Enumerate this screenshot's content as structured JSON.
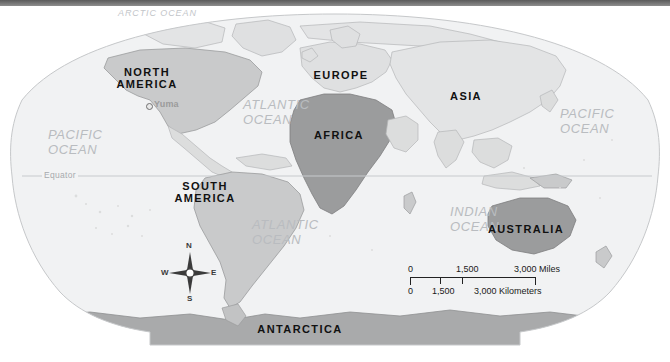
{
  "map": {
    "title": "World Map",
    "projection": "oval",
    "colors": {
      "ocean": "#f1f2f3",
      "land_light": "#dfe0e1",
      "land_mid": "#c9cacb",
      "land_dark": "#9b9c9d",
      "outline": "#b4b6b8",
      "ocean_label": "#b9bcc0",
      "continent_label": "#111111",
      "city_label": "#9b9b9b",
      "top_bar": "#6f6f6f"
    },
    "continents": [
      {
        "name": "NORTH\nAMERICA",
        "line1": "NORTH",
        "line2": "AMERICA",
        "x": 141,
        "y": 74
      },
      {
        "name": "SOUTH\nAMERICA",
        "line1": "SOUTH",
        "line2": "AMERICA",
        "x": 199,
        "y": 188
      },
      {
        "name": "EUROPE",
        "line1": "EUROPE",
        "line2": "",
        "x": 341,
        "y": 76
      },
      {
        "name": "AFRICA",
        "line1": "AFRICA",
        "line2": "",
        "x": 339,
        "y": 136
      },
      {
        "name": "ASIA",
        "line1": "ASIA",
        "line2": "",
        "x": 466,
        "y": 97
      },
      {
        "name": "AUSTRALIA",
        "line1": "AUSTRALIA",
        "line2": "",
        "x": 526,
        "y": 230
      },
      {
        "name": "ANTARCTICA",
        "line1": "ANTARCTICA",
        "line2": "",
        "x": 300,
        "y": 330
      }
    ],
    "oceans": [
      {
        "name": "ARCTIC OCEAN",
        "line1": "ARCTIC OCEAN",
        "line2": "",
        "x": 160,
        "y": 14,
        "size": "small"
      },
      {
        "name": "PACIFIC OCEAN",
        "line1": "PACIFIC",
        "line2": "OCEAN",
        "x": 84,
        "y": 138,
        "size": "normal"
      },
      {
        "name": "PACIFIC OCEAN",
        "line1": "PACIFIC",
        "line2": "OCEAN",
        "x": 592,
        "y": 117,
        "size": "normal"
      },
      {
        "name": "ATLANTIC OCEAN",
        "line1": "ATLANTIC",
        "line2": "OCEAN",
        "x": 282,
        "y": 108,
        "size": "normal"
      },
      {
        "name": "ATLANTIC OCEAN",
        "line1": "ATLANTIC",
        "line2": "OCEAN",
        "x": 291,
        "y": 228,
        "size": "normal"
      },
      {
        "name": "INDIAN OCEAN",
        "line1": "INDIAN",
        "line2": "OCEAN",
        "x": 471,
        "y": 215,
        "size": "normal"
      }
    ],
    "cities": [
      {
        "name": "Yuma",
        "label": "Yuma",
        "x": 155,
        "y": 105
      }
    ],
    "equator": {
      "label": "Equator",
      "y": 176,
      "x1": 28,
      "x2": 648,
      "label_x": 47
    }
  },
  "compass": {
    "north": "N",
    "east": "E",
    "south": "S",
    "west": "W",
    "x": 189,
    "y": 273
  },
  "scale": {
    "miles": {
      "zero": "0",
      "mid": "1,500",
      "max": "3,000",
      "unit": "Miles",
      "max_with_unit": "3,000 Miles"
    },
    "kilometers": {
      "zero": "0",
      "mid": "1,500",
      "max": "3,000",
      "unit": "Kilometers",
      "max_with_unit": "3,000 Kilometers"
    }
  }
}
